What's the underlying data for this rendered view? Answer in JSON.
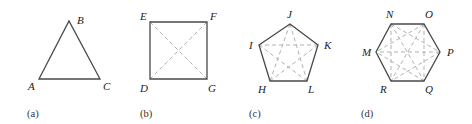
{
  "figures": [
    {
      "id": "a",
      "caption": "(a)",
      "shape": "triangle",
      "vertices": [
        {
          "label": "A",
          "x": 39,
          "y": 79
        },
        {
          "label": "B",
          "x": 69,
          "y": 21
        },
        {
          "label": "C",
          "x": 100,
          "y": 79
        }
      ],
      "diagonals": []
    },
    {
      "id": "b",
      "caption": "(b)",
      "shape": "square",
      "vertices": [
        {
          "label": "E",
          "x": 150,
          "y": 22
        },
        {
          "label": "F",
          "x": 207,
          "y": 22
        },
        {
          "label": "G",
          "x": 207,
          "y": 79
        },
        {
          "label": "D",
          "x": 150,
          "y": 79
        }
      ],
      "diagonals": [
        [
          "E",
          "G"
        ],
        [
          "F",
          "D"
        ]
      ]
    },
    {
      "id": "c",
      "caption": "(c)",
      "shape": "pentagon",
      "vertices": [
        {
          "label": "J",
          "x": 290,
          "y": 24
        },
        {
          "label": "K",
          "x": 318,
          "y": 45
        },
        {
          "label": "L",
          "x": 307,
          "y": 81
        },
        {
          "label": "H",
          "x": 270,
          "y": 81
        },
        {
          "label": "I",
          "x": 259,
          "y": 45
        }
      ],
      "diagonals": [
        [
          "J",
          "L"
        ],
        [
          "J",
          "H"
        ],
        [
          "K",
          "H"
        ],
        [
          "K",
          "I"
        ],
        [
          "L",
          "I"
        ]
      ]
    },
    {
      "id": "d",
      "caption": "(d)",
      "shape": "hexagon",
      "vertices": [
        {
          "label": "N",
          "x": 391,
          "y": 24
        },
        {
          "label": "O",
          "x": 424,
          "y": 24
        },
        {
          "label": "P",
          "x": 440,
          "y": 52
        },
        {
          "label": "Q",
          "x": 424,
          "y": 81
        },
        {
          "label": "R",
          "x": 391,
          "y": 81
        },
        {
          "label": "M",
          "x": 376,
          "y": 52
        }
      ],
      "diagonals": [
        [
          "N",
          "P"
        ],
        [
          "N",
          "Q"
        ],
        [
          "N",
          "R"
        ],
        [
          "O",
          "Q"
        ],
        [
          "O",
          "R"
        ],
        [
          "O",
          "M"
        ],
        [
          "P",
          "R"
        ],
        [
          "P",
          "M"
        ],
        [
          "Q",
          "M"
        ]
      ]
    }
  ],
  "colors": {
    "edge": "#4a4a4a",
    "diagonal": "#a8a8a8",
    "label": "#222222"
  }
}
